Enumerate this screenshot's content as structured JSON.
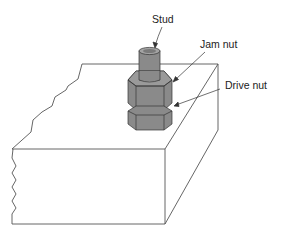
{
  "diagram": {
    "type": "mechanical illustration",
    "labels": {
      "stud": "Stud",
      "jam_nut": "Jam nut",
      "drive_nut": "Drive nut"
    },
    "colors": {
      "line": "#444444",
      "metal": "#8a8a8a",
      "metal_dark": "#6e6e6e",
      "metal_light": "#a3a3a3",
      "background": "#ffffff"
    }
  }
}
